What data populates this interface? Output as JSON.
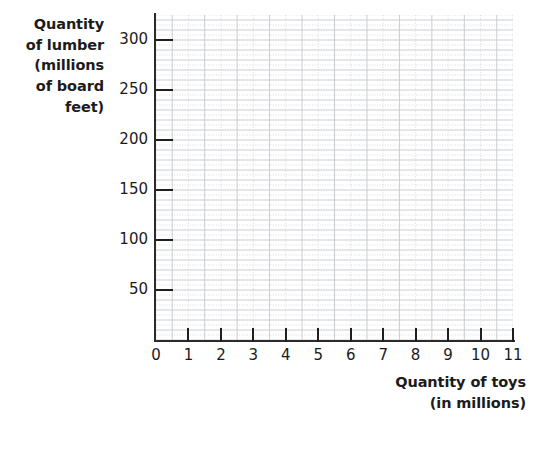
{
  "chart_data": {
    "type": "line",
    "title": "",
    "subtitle": "",
    "xlabel": "Quantity of toys (in millions)",
    "ylabel": "Quantity of lumber (millions of board feet)",
    "xlabel_lines": [
      "Quantity of toys",
      "(in millions)"
    ],
    "ylabel_lines": [
      "Quantity",
      "of lumber",
      "(millions",
      "of board",
      "feet)"
    ],
    "xlim": [
      0,
      11
    ],
    "ylim": [
      0,
      325
    ],
    "xticks": [
      0,
      1,
      2,
      3,
      4,
      5,
      6,
      7,
      8,
      9,
      10,
      11
    ],
    "xtick_labels": [
      "0",
      "1",
      "2",
      "3",
      "4",
      "5",
      "6",
      "7",
      "8",
      "9",
      "10",
      "11"
    ],
    "yticks": [
      50,
      100,
      150,
      200,
      250,
      300
    ],
    "ytick_labels": [
      "50",
      "100",
      "150",
      "200",
      "250",
      "300"
    ],
    "grid": true,
    "grid_minor": true,
    "grid_major_color": "#c9cdd2",
    "grid_minor_color": "#d8dce1",
    "axis_color": "#2b2b2b",
    "background_color": "#ffffff",
    "series": [],
    "values": [],
    "categories": [],
    "annotations": [],
    "legend": null,
    "note": "Empty graph-paper grid with no plotted data series"
  },
  "grid_spec": {
    "y_major_step": 50,
    "y_minor_step": 10,
    "y_dotted_step": 10,
    "x_major_step": 1,
    "x_minor_step": 0.5
  }
}
